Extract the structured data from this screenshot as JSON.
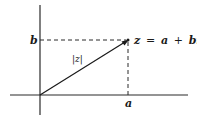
{
  "diagram": {
    "type": "complex-plane",
    "axes": {
      "color": "#2a2a2a",
      "origin": [
        40,
        95
      ],
      "vertical": {
        "x": 40,
        "y_top": 5,
        "y_bottom": 115
      },
      "horizontal": {
        "y": 95,
        "x_left": 10,
        "x_right": 188
      }
    },
    "point": {
      "name": "z",
      "position": [
        128,
        40
      ],
      "label_lhs": "z",
      "label_eq": "=",
      "label_rhs_a": "a",
      "label_plus": "+",
      "label_rhs_bi": "bi"
    },
    "vector": {
      "from": [
        40,
        95
      ],
      "to": [
        128,
        40
      ],
      "label": "|z|"
    },
    "projections": {
      "style": "dashed",
      "to_imag_axis": {
        "from": [
          40,
          40
        ],
        "to": [
          128,
          40
        ]
      },
      "to_real_axis": {
        "from": [
          128,
          40
        ],
        "to": [
          128,
          95
        ]
      }
    },
    "tick_labels": {
      "imag": "b",
      "real": "a"
    }
  }
}
